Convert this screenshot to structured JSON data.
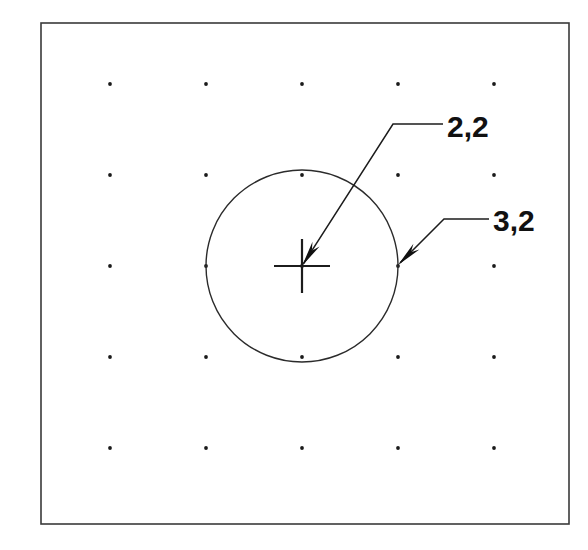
{
  "drawing": {
    "title": "Circle on dot grid with coordinate callouts",
    "background_color": "#ffffff",
    "line_color": "#1c1c1c",
    "frame": {
      "name": "drawing-border",
      "x": 41,
      "y": 23,
      "width": 528,
      "height": 501,
      "stroke": "#3a3a3a"
    },
    "grid": {
      "label": "dot grid",
      "dot_color": "#1a1a1a",
      "dot_radius": 1.9,
      "origin_x": 110,
      "origin_y": 84,
      "spacing_x": 96,
      "spacing_y": 91,
      "columns": 5,
      "rows": 5,
      "column_indices": [
        0,
        1,
        2,
        3,
        4
      ],
      "row_indices": [
        0,
        1,
        2,
        3,
        4
      ]
    },
    "circle": {
      "name": "construction-circle",
      "center_x": 302,
      "center_y": 266,
      "radius": 96,
      "stroke": "#2b2b2b"
    },
    "center_mark": {
      "name": "center-crosshair",
      "x": 302,
      "y": 266,
      "half_width": 28,
      "half_height": 27
    },
    "callouts": [
      {
        "id": "callout-center",
        "label": "2,2",
        "meaning": "circle center point",
        "arrow_tip_x": 302,
        "arrow_tip_y": 266,
        "bend_x": 393,
        "bend_y": 124,
        "end_x": 443,
        "end_y": 124,
        "text_x": 447,
        "text_y": 137
      },
      {
        "id": "callout-edge",
        "label": "3,2",
        "meaning": "point on circle at right quadrant",
        "arrow_tip_x": 398,
        "arrow_tip_y": 265,
        "bend_x": 444,
        "bend_y": 219,
        "end_x": 489,
        "end_y": 219,
        "text_x": 493,
        "text_y": 231
      }
    ]
  }
}
